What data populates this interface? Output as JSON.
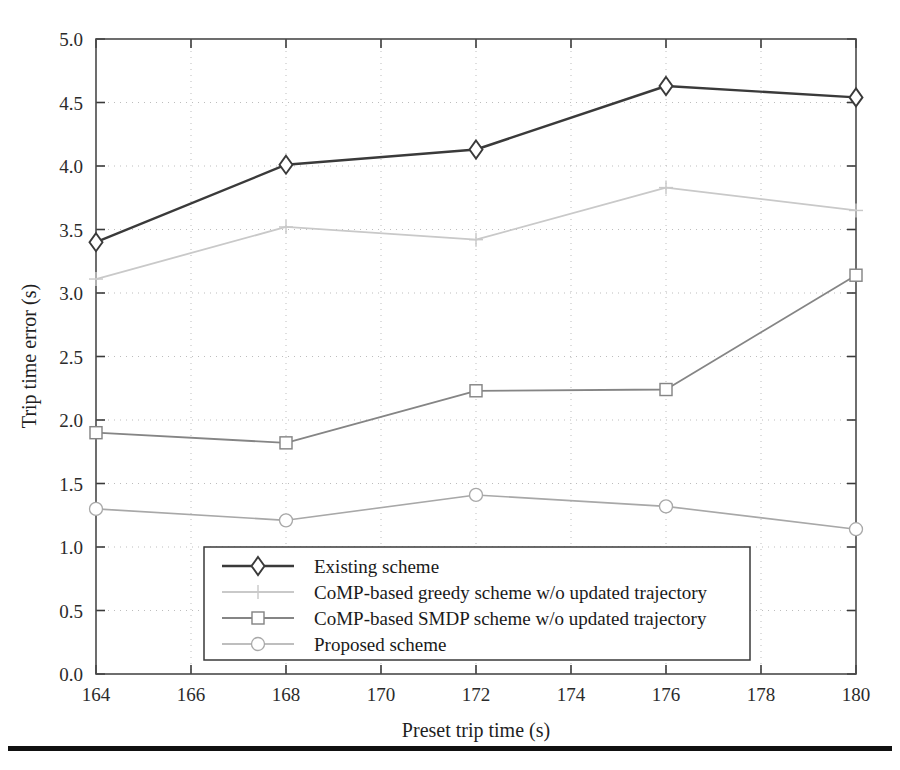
{
  "figure": {
    "background_color": "#ffffff",
    "rule_color": "#111111"
  },
  "chart_data": {
    "type": "line",
    "title": "",
    "xlabel": "Preset trip time (s)",
    "ylabel": "Trip time error (s)",
    "xlim": [
      164,
      180
    ],
    "ylim": [
      0.0,
      5.0
    ],
    "xticks": [
      164,
      166,
      168,
      170,
      172,
      174,
      176,
      178,
      180
    ],
    "xtick_labels": [
      "164",
      "166",
      "168",
      "170",
      "172",
      "174",
      "176",
      "178",
      "180"
    ],
    "yticks": [
      0.0,
      0.5,
      1.0,
      1.5,
      2.0,
      2.5,
      3.0,
      3.5,
      4.0,
      4.5,
      5.0
    ],
    "ytick_labels": [
      "0.0",
      "0.5",
      "1.0",
      "1.5",
      "2.0",
      "2.5",
      "3.0",
      "3.5",
      "4.0",
      "4.5",
      "5.0"
    ],
    "grid": true,
    "grid_style": "dotted",
    "legend_position": "lower center",
    "x": [
      164,
      168,
      172,
      176,
      180
    ],
    "series": [
      {
        "name": "Existing scheme",
        "values": [
          3.4,
          4.01,
          4.13,
          4.63,
          4.54
        ],
        "color": "#3a3a3a",
        "line_width": 2.4,
        "marker": "diamond"
      },
      {
        "name": "CoMP-based greedy scheme w/o updated trajectory",
        "values": [
          3.11,
          3.52,
          3.42,
          3.83,
          3.65
        ],
        "color": "#c9c9c9",
        "line_width": 1.8,
        "marker": "plus"
      },
      {
        "name": "CoMP-based SMDP scheme w/o updated trajectory",
        "values": [
          1.9,
          1.82,
          2.23,
          2.24,
          3.14
        ],
        "color": "#858585",
        "line_width": 1.8,
        "marker": "square"
      },
      {
        "name": "Proposed scheme",
        "values": [
          1.3,
          1.21,
          1.41,
          1.32,
          1.14
        ],
        "color": "#a8a8a8",
        "line_width": 1.6,
        "marker": "circle"
      }
    ]
  }
}
